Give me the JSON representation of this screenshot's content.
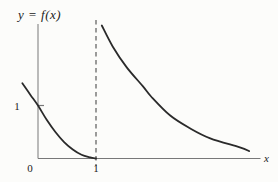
{
  "figure": {
    "kind": "function-graph",
    "description_visible_text_only": true
  },
  "colors": {
    "background": "#fcfcfa",
    "curve": "#2a2a2a",
    "axis": "#787878",
    "dashed": "#4a4a4a",
    "text": "#222222"
  },
  "chart_data": {
    "type": "line",
    "title": "y = f(x)",
    "xlabel": "x",
    "ylabel": "",
    "grid": false,
    "legend": false,
    "xlim": [
      -0.31,
      3.86
    ],
    "ylim": [
      0,
      2.65
    ],
    "x_ticks": [
      {
        "value": 0,
        "label": "0"
      },
      {
        "value": 1,
        "label": "1"
      }
    ],
    "y_ticks": [
      {
        "value": 1,
        "label": "1"
      }
    ],
    "vertical_asymptote_x": 1,
    "series": [
      {
        "name": "left branch (x < 1)",
        "points": [
          [
            -0.27,
            1.42
          ],
          [
            -0.13,
            1.2
          ],
          [
            0,
            1.0
          ],
          [
            0.15,
            0.73
          ],
          [
            0.3,
            0.5
          ],
          [
            0.45,
            0.31
          ],
          [
            0.6,
            0.17
          ],
          [
            0.75,
            0.07
          ],
          [
            0.9,
            0.02
          ],
          [
            1.0,
            0
          ]
        ]
      },
      {
        "name": "right branch (x > 1)",
        "points": [
          [
            1.1,
            2.51
          ],
          [
            1.29,
            2.11
          ],
          [
            1.53,
            1.72
          ],
          [
            1.81,
            1.36
          ],
          [
            1.95,
            1.17
          ],
          [
            2.28,
            0.81
          ],
          [
            2.62,
            0.57
          ],
          [
            2.97,
            0.38
          ],
          [
            3.48,
            0.21
          ],
          [
            3.64,
            0.14
          ]
        ]
      }
    ]
  }
}
